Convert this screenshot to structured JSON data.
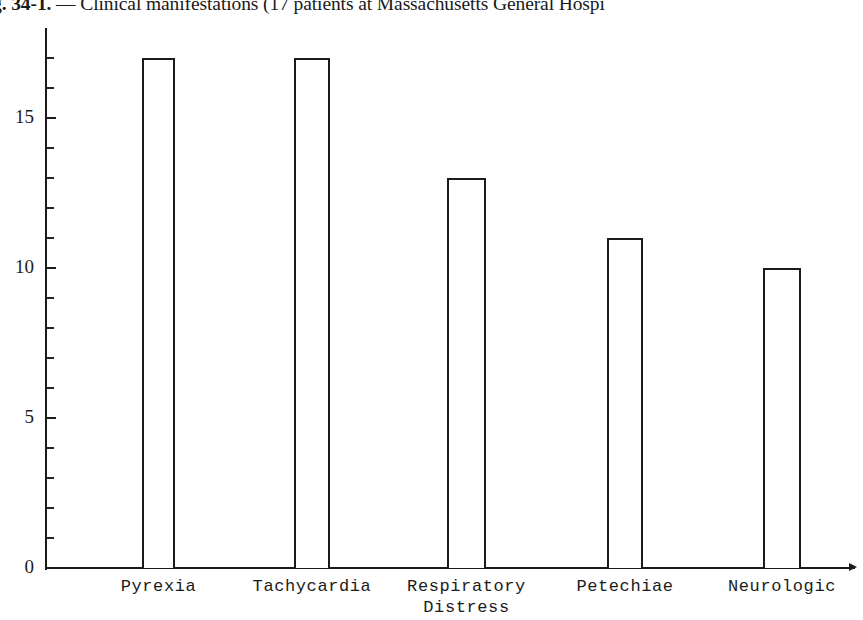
{
  "caption": {
    "label": "g. 34-1.",
    "text": " — Clinical manifestations (17 patients at Massachusetts General Hospi"
  },
  "chart_data": {
    "type": "bar",
    "title": "g. 34-1. — Clinical manifestations (17 patients at Massachusetts General Hospi",
    "xlabel": "",
    "ylabel": "",
    "ylim": [
      0,
      18
    ],
    "grid": false,
    "legend": "none",
    "categories": [
      "Pyrexia",
      "Tachycardia",
      "Respiratory\nDistress",
      "Petechiae",
      "Neurologic"
    ],
    "values": [
      17,
      17,
      13,
      11,
      10
    ],
    "tick_labels": [
      "0",
      "5",
      "10",
      "15"
    ],
    "tick_values": [
      0,
      5,
      10,
      15
    ],
    "minor_tick_values": [
      1,
      2,
      3,
      4,
      6,
      7,
      8,
      9,
      11,
      12,
      13,
      14,
      16,
      17
    ],
    "bar_style": {
      "fill": "#ffffff",
      "edge": "#1b1b1b",
      "edge_width": 2
    }
  },
  "axis": {
    "color": "#1b1b1b"
  }
}
